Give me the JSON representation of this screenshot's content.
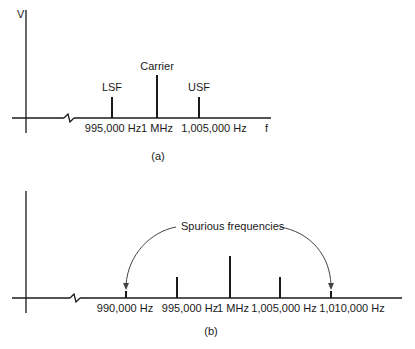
{
  "panel_a": {
    "y_axis_label": "V",
    "x_axis_label": "f",
    "caption": "(a)",
    "lines": [
      {
        "name": "LSF",
        "label": "LSF",
        "freq_label": "995,000 Hz"
      },
      {
        "name": "Carrier",
        "label": "Carrier",
        "freq_label": "1 MHz"
      },
      {
        "name": "USF",
        "label": "USF",
        "freq_label": "1,005,000 Hz"
      }
    ]
  },
  "panel_b": {
    "caption": "(b)",
    "annotation": "Spurious frequencies",
    "freq_labels": [
      "990,000 Hz",
      "995,000 Hz",
      "1 MHz",
      "1,005,000 Hz",
      "1,010,000 Hz"
    ]
  },
  "colors": {
    "ink": "#1a1a1a",
    "arrow": "#444444",
    "background": "#ffffff"
  }
}
